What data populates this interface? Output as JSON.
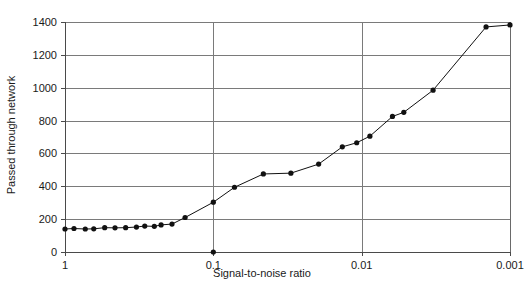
{
  "chart_data": {
    "type": "line",
    "title": "",
    "xlabel": "Signal-to-noise ratio",
    "ylabel": "Passed through network",
    "x_scale": "log-reversed",
    "xlim": [
      1,
      0.001
    ],
    "ylim": [
      0,
      1400
    ],
    "grid": true,
    "legend": "none",
    "x_tick_labels": [
      "1",
      "0.1",
      "0.01",
      "0.001"
    ],
    "x_ticks": [
      1,
      0.1,
      0.01,
      0.001
    ],
    "y_tick_labels": [
      "0",
      "200",
      "400",
      "600",
      "800",
      "1000",
      "1200",
      "1400"
    ],
    "y_ticks": [
      0,
      200,
      400,
      600,
      800,
      1000,
      1200,
      1400
    ],
    "series": [
      {
        "name": "Passed through network",
        "marker": "filled-circle",
        "x": [
          1.0,
          0.87,
          0.73,
          0.64,
          0.54,
          0.46,
          0.39,
          0.33,
          0.29,
          0.25,
          0.225,
          0.19,
          0.155,
          0.1,
          0.072,
          0.046,
          0.03,
          0.0195,
          0.0135,
          0.0108,
          0.0088,
          0.0062,
          0.0052,
          0.0033,
          0.00145,
          0.001
        ],
        "y": [
          140,
          143,
          140,
          141,
          148,
          147,
          148,
          152,
          158,
          156,
          165,
          170,
          210,
          303,
          394,
          475,
          480,
          535,
          640,
          665,
          705,
          825,
          850,
          985,
          1370,
          1382
        ]
      },
      {
        "name": "outlier-zero-point",
        "marker": "filled-circle",
        "connected": false,
        "x": [
          0.1
        ],
        "y": [
          0
        ]
      }
    ]
  },
  "axis": {
    "y_title": "Passed through network",
    "x_title": "Signal-to-noise ratio"
  }
}
